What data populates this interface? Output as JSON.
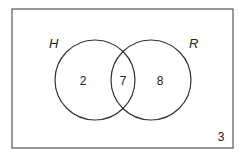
{
  "diagram": {
    "type": "venn",
    "universal_set_count": "3",
    "sets": [
      {
        "name": "H",
        "only_count": "2"
      },
      {
        "name": "R",
        "only_count": "8"
      }
    ],
    "intersection_count": "7",
    "colors": {
      "stroke": "#333333",
      "background": "#ffffff"
    }
  }
}
